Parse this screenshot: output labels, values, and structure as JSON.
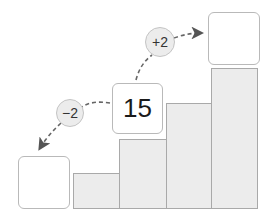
{
  "diagram": {
    "center_box": {
      "value": "15"
    },
    "left_box": {
      "value": ""
    },
    "right_box": {
      "value": ""
    },
    "minus_step": {
      "label": "−2"
    },
    "plus_step": {
      "label": "+2"
    },
    "bars": [
      {
        "id": "bar-1",
        "relative_height": 1
      },
      {
        "id": "bar-2",
        "relative_height": 2
      },
      {
        "id": "bar-3",
        "relative_height": 3
      },
      {
        "id": "bar-4",
        "relative_height": 4
      }
    ],
    "colors": {
      "bar_fill": "#ececec",
      "bar_border": "#a9a9a9",
      "box_border": "#b9b9b9",
      "circle_fill": "#ececec",
      "arrow": "#666666"
    }
  }
}
